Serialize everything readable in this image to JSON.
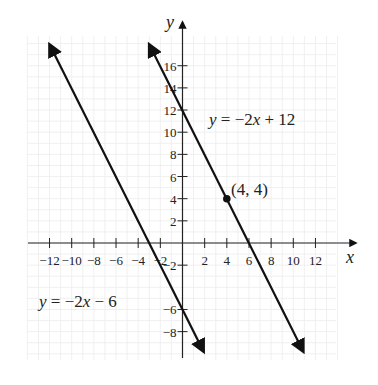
{
  "chart_data": {
    "type": "line",
    "title": "",
    "xlabel": "x",
    "ylabel": "y",
    "xlim": [
      -14,
      14
    ],
    "ylim": [
      -10,
      18
    ],
    "grid": true,
    "x_ticks": [
      -12,
      -10,
      -8,
      -6,
      -4,
      -2,
      2,
      4,
      6,
      8,
      10,
      12
    ],
    "y_ticks": [
      -8,
      -6,
      -2,
      2,
      4,
      6,
      8,
      10,
      12,
      14,
      16
    ],
    "series": [
      {
        "name": "y = -2x - 6",
        "slope": -2,
        "intercept": -6,
        "x": [
          -12,
          1.9
        ],
        "y": [
          18,
          -9.8
        ]
      },
      {
        "name": "y = -2x + 12",
        "slope": -2,
        "intercept": 12,
        "x": [
          -3,
          10.9
        ],
        "y": [
          18,
          -9.8
        ]
      }
    ],
    "points": [
      {
        "x": 4,
        "y": 4,
        "label": "(4, 4)"
      }
    ],
    "annotations": [
      {
        "text": "y = −2x + 12",
        "near_series": 1
      },
      {
        "text": "y = −2x − 6",
        "near_series": 0
      },
      {
        "text": "(4, 4)",
        "at": [
          4,
          4
        ]
      }
    ],
    "colors": {
      "lines": "#111111",
      "axes": "#222222",
      "grid": "#ececec"
    }
  },
  "labels": {
    "x_axis": "x",
    "y_axis": "y",
    "eq1": {
      "y": "y",
      "rest": " = −2",
      "x": "x",
      "tail": " + 12"
    },
    "eq2": {
      "y": "y",
      "rest": " = −2",
      "x": "x",
      "tail": " − 6"
    },
    "point": "(4, 4)",
    "x_tick_labels": [
      "−12",
      "−10",
      "−8",
      "−6",
      "−4",
      "−2",
      "2",
      "4",
      "6",
      "8",
      "10",
      "12"
    ],
    "y_tick_labels_pos": [
      "2",
      "4",
      "6",
      "8",
      "10",
      "12",
      "14",
      "16"
    ],
    "y_tick_labels_neg": [
      "−2",
      "−6",
      "−8"
    ]
  }
}
